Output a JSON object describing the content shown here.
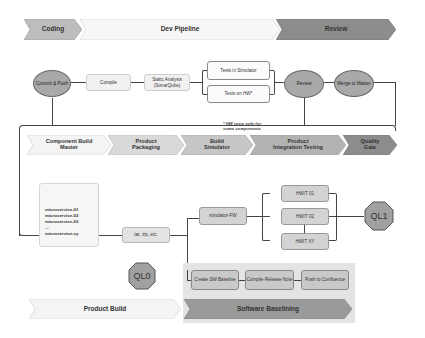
{
  "stages_top": {
    "coding": "Coding",
    "dev_pipeline": "Dev Pipeline",
    "review": "Review"
  },
  "dev_pipeline": {
    "commit_push": "Commit & Push",
    "compile": "Compile",
    "static_analysis": "Static Analysis (SonarQube)",
    "tests_simulator": "Tests in Simulator",
    "tests_hw": "Tests on HW*",
    "review": "Review",
    "merge_master": "Merge to Master",
    "footnote_line1": "* HW tests only for",
    "footnote_line2": "some components"
  },
  "stages_bottom": {
    "component_build_line1": "Component Build",
    "component_build_line2": "Master",
    "product_packaging_line1": "Product",
    "product_packaging_line2": "Packaging",
    "build_simulator_line1": "Build",
    "build_simulator_line2": "Simulator",
    "integration_line1": "Product",
    "integration_line2": "Integration Testing",
    "quality_gate_line1": "Quality",
    "quality_gate_line2": "Gate"
  },
  "product_build": {
    "microservices": [
      "microservice-01",
      "microservice-02",
      "microservice-03",
      "...",
      "microservice-xy"
    ],
    "packaging": "tar, zip, etc.",
    "simulator_fw": "simulator-FW",
    "hwit": [
      "HWIT 01",
      "HWIT 02",
      "HWIT XY"
    ],
    "ql0": "QL0",
    "ql1": "QL1"
  },
  "baselining": {
    "create_sw_baseline": "Create SW Baseline",
    "compile_release_note": "Compile Release Note",
    "push_confluence": "Push to Confluence"
  },
  "stages_footer": {
    "product_build": "Product Build",
    "software_baselining": "Software Baselining"
  },
  "colors": {
    "dark_chevron": "#8c8c8c",
    "mid_chevron": "#bdbdbd",
    "light_chevron": "#efefef",
    "node_fill": "#a9a9a9",
    "box_fill": "#e2e2e2",
    "line": "#444444"
  }
}
